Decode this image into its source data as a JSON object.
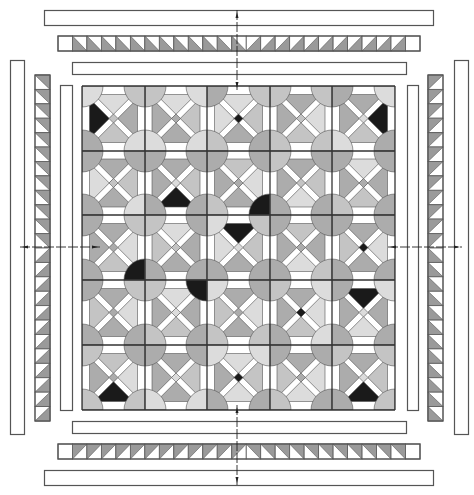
{
  "diagram": {
    "type": "quilt-assembly-diagram",
    "canvas": {
      "width": 474,
      "height": 495,
      "background": "#ffffff"
    },
    "colors": {
      "outline": "#555555",
      "grid_line": "#333333",
      "white": "#ffffff",
      "light": "#dcdcdc",
      "medium_light": "#c4c4c4",
      "medium": "#acacac",
      "medium_dark": "#969696",
      "dark": "#1a1a1a",
      "hst_gray": "#9a9a9a",
      "center_mark": "#222222"
    },
    "center_block_grid": {
      "columns": 5,
      "rows": 5,
      "col_lines": [
        82,
        145,
        207,
        270,
        332,
        395
      ],
      "row_lines": [
        86,
        151,
        215,
        280,
        345,
        410
      ],
      "circle_radius": 21,
      "cross_bar_width": 6,
      "blocks": [
        [
          {
            "top": "light",
            "right": "medium",
            "bottom": "medium_light",
            "left": "dark",
            "center": "medium_light"
          },
          {
            "top": "light",
            "right": "medium_light",
            "bottom": "medium",
            "left": "medium",
            "center": "medium"
          },
          {
            "top": "light",
            "right": "medium_light",
            "bottom": "medium",
            "left": "light",
            "center": "dark"
          },
          {
            "top": "medium",
            "right": "light",
            "bottom": "medium_light",
            "left": "medium",
            "center": "medium_light"
          },
          {
            "top": "medium",
            "right": "dark",
            "bottom": "medium_light",
            "left": "medium",
            "center": "light"
          }
        ],
        [
          {
            "top": "medium",
            "right": "medium_light",
            "bottom": "medium",
            "left": "light",
            "center": "medium_light"
          },
          {
            "top": "medium",
            "right": "medium_light",
            "bottom": "dark",
            "left": "medium",
            "center": "light"
          },
          {
            "top": "medium_light",
            "right": "light",
            "bottom": "medium",
            "left": "medium",
            "center": "medium"
          },
          {
            "top": "medium",
            "right": "medium_light",
            "bottom": "light",
            "left": "medium",
            "center": "medium_light"
          },
          {
            "top": "light",
            "right": "medium",
            "bottom": "medium_light",
            "left": "medium",
            "center": "medium"
          }
        ],
        [
          {
            "top": "medium",
            "right": "light",
            "bottom": "medium_light",
            "left": "medium",
            "center": "medium"
          },
          {
            "top": "light",
            "right": "medium",
            "bottom": "medium",
            "left": "medium_light",
            "center": "medium_light"
          },
          {
            "top": "dark",
            "right": "medium_light",
            "bottom": "medium",
            "left": "light",
            "center": "light"
          },
          {
            "top": "medium_light",
            "right": "medium",
            "bottom": "light",
            "left": "medium",
            "center": "medium"
          },
          {
            "top": "medium",
            "right": "light",
            "bottom": "medium",
            "left": "medium_light",
            "center": "dark"
          }
        ],
        [
          {
            "top": "medium",
            "right": "light",
            "bottom": "medium",
            "left": "medium_light",
            "center": "medium"
          },
          {
            "top": "light",
            "right": "medium",
            "bottom": "medium_light",
            "left": "medium",
            "center": "light"
          },
          {
            "top": "medium",
            "right": "light",
            "bottom": "medium",
            "left": "medium_light",
            "center": "medium"
          },
          {
            "top": "medium",
            "right": "light",
            "bottom": "medium_light",
            "left": "medium",
            "center": "dark"
          },
          {
            "top": "dark",
            "right": "medium",
            "bottom": "light",
            "left": "medium",
            "center": "light"
          }
        ],
        [
          {
            "top": "medium_light",
            "right": "light",
            "bottom": "dark",
            "left": "medium",
            "center": "medium"
          },
          {
            "top": "medium",
            "right": "medium_light",
            "bottom": "medium",
            "left": "medium",
            "center": "light"
          },
          {
            "top": "light",
            "right": "medium_light",
            "bottom": "light",
            "left": "medium",
            "center": "dark"
          },
          {
            "top": "medium",
            "right": "light",
            "bottom": "light",
            "left": "medium_light",
            "center": "medium"
          },
          {
            "top": "medium",
            "right": "medium_light",
            "bottom": "dark",
            "left": "medium",
            "center": "light"
          }
        ]
      ],
      "circles": [
        [
          [
            "light",
            "light",
            "light",
            "light"
          ],
          [
            "medium",
            "medium",
            "medium_light",
            "medium_light"
          ],
          [
            "medium_light",
            "medium",
            "medium",
            "light"
          ],
          [
            "medium",
            "medium",
            "medium_light",
            "medium_light"
          ],
          [
            "light",
            "medium",
            "medium",
            "medium_light"
          ],
          [
            "medium_light",
            "light",
            "light",
            "light"
          ]
        ],
        [
          [
            "medium",
            "medium",
            "medium",
            "medium"
          ],
          [
            "light",
            "light",
            "medium",
            "medium"
          ],
          [
            "light",
            "medium_light",
            "medium",
            "medium"
          ],
          [
            "medium",
            "medium_light",
            "medium_light",
            "medium"
          ],
          [
            "medium_light",
            "light",
            "medium",
            "medium"
          ],
          [
            "medium",
            "medium",
            "medium_light",
            "medium"
          ]
        ],
        [
          [
            "medium_light",
            "medium",
            "medium",
            "light"
          ],
          [
            "light",
            "medium",
            "medium_light",
            "medium_light"
          ],
          [
            "medium",
            "medium_light",
            "light",
            "medium"
          ],
          [
            "dark",
            "medium",
            "medium",
            "medium_light"
          ],
          [
            "medium",
            "medium_light",
            "medium",
            "medium"
          ],
          [
            "medium",
            "medium",
            "medium",
            "medium"
          ]
        ],
        [
          [
            "medium_light",
            "medium",
            "medium",
            "light"
          ],
          [
            "dark",
            "medium",
            "medium_light",
            "medium_light"
          ],
          [
            "medium",
            "medium",
            "light",
            "dark"
          ],
          [
            "medium",
            "medium",
            "medium_light",
            "medium"
          ],
          [
            "medium_light",
            "medium",
            "medium",
            "light"
          ],
          [
            "medium",
            "medium",
            "light",
            "light"
          ]
        ],
        [
          [
            "medium",
            "medium",
            "medium_light",
            "medium"
          ],
          [
            "medium",
            "medium_light",
            "medium",
            "medium"
          ],
          [
            "medium",
            "medium_light",
            "light",
            "medium"
          ],
          [
            "medium_light",
            "medium",
            "medium",
            "light"
          ],
          [
            "light",
            "medium",
            "medium_light",
            "medium"
          ],
          [
            "medium",
            "light",
            "medium",
            "medium_light"
          ]
        ],
        [
          [
            "medium_light",
            "medium_light",
            "medium_light",
            "medium_light"
          ],
          [
            "medium_light",
            "light",
            "medium",
            "medium_light"
          ],
          [
            "light",
            "medium",
            "medium_light",
            "medium"
          ],
          [
            "medium",
            "medium_light",
            "medium",
            "medium"
          ],
          [
            "medium",
            "medium",
            "medium_light",
            "medium"
          ],
          [
            "medium_light",
            "medium",
            "medium",
            "medium"
          ]
        ]
      ]
    },
    "borders": {
      "plain_strips": [
        {
          "name": "top-outer-border",
          "x": 44,
          "y": 10,
          "w": 389,
          "h": 15
        },
        {
          "name": "top-inner-border",
          "x": 72,
          "y": 62,
          "w": 334,
          "h": 12
        },
        {
          "name": "bottom-inner-border",
          "x": 72,
          "y": 421,
          "w": 334,
          "h": 12
        },
        {
          "name": "bottom-outer-border",
          "x": 44,
          "y": 470,
          "w": 389,
          "h": 15
        },
        {
          "name": "left-outer-border",
          "x": 10,
          "y": 60,
          "w": 14,
          "h": 374
        },
        {
          "name": "left-inner-border",
          "x": 60,
          "y": 85,
          "w": 12,
          "h": 325
        },
        {
          "name": "right-inner-border",
          "x": 407,
          "y": 85,
          "w": 11,
          "h": 325
        },
        {
          "name": "right-outer-border",
          "x": 454,
          "y": 60,
          "w": 14,
          "h": 374
        }
      ],
      "hst_strips": [
        {
          "name": "top-hst-border",
          "orientation": "horizontal",
          "x": 58,
          "y": 36,
          "length": 362,
          "thickness": 15,
          "cell": 14.5,
          "end_squares": "right",
          "start_square": true,
          "half_a": "gray-bottom-left",
          "half_b": "gray-bottom-right"
        },
        {
          "name": "bottom-hst-border",
          "orientation": "horizontal",
          "x": 58,
          "y": 444,
          "length": 362,
          "thickness": 15,
          "cell": 14.5,
          "start_square": true,
          "half_a": "gray-top-left",
          "half_b": "gray-top-right"
        },
        {
          "name": "left-hst-border",
          "orientation": "vertical",
          "x": 35,
          "y": 75,
          "length": 346,
          "thickness": 15,
          "cell": 14.4,
          "start_square": false,
          "half_a": "gray-top-right",
          "half_b": "gray-bottom-right"
        },
        {
          "name": "right-hst-border",
          "orientation": "vertical",
          "x": 428,
          "y": 75,
          "length": 346,
          "thickness": 15,
          "cell": 14.4,
          "start_square": false,
          "half_a": "gray-top-left",
          "half_b": "gray-bottom-left"
        }
      ]
    },
    "center_marks": {
      "vertical_x": 237,
      "horizontal_y": 247,
      "vertical_segments": [
        [
          10,
          90
        ],
        [
          405,
          485
        ]
      ],
      "horizontal_segments": [
        [
          20,
          100
        ],
        [
          388,
          462
        ]
      ]
    }
  }
}
